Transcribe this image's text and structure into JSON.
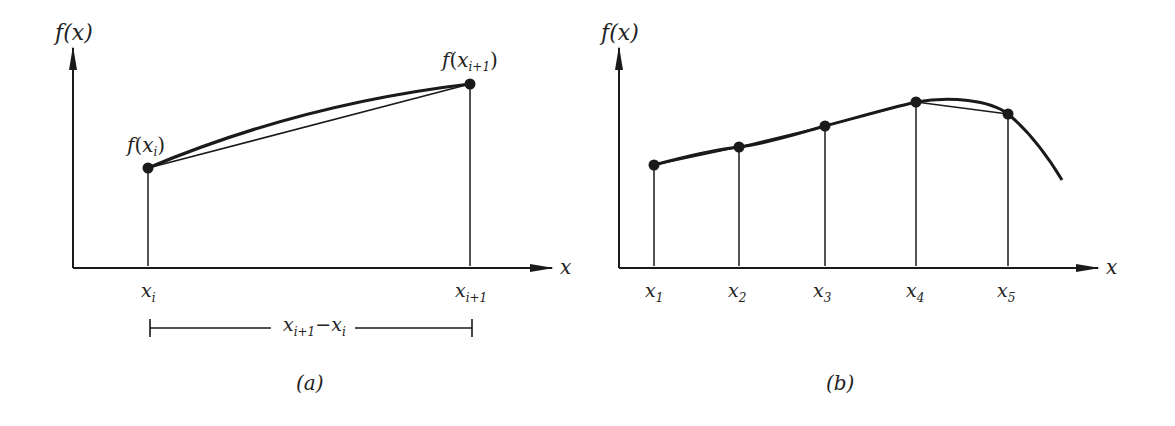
{
  "panel_a": {
    "y_axis_label": "f(x)",
    "x_axis_label": "x",
    "point_left_label": {
      "f": "f",
      "var": "x",
      "sub": "i"
    },
    "point_right_label": {
      "f": "f",
      "var": "x",
      "sub": "i+1"
    },
    "tick_left": {
      "var": "x",
      "sub": "i"
    },
    "tick_right": {
      "var": "x",
      "sub": "i+1"
    },
    "interval_label": {
      "var1": "x",
      "sub1": "i+1",
      "minus": "−",
      "var2": "x",
      "sub2": "i"
    },
    "caption": "(a)",
    "points": [
      [
        148,
        168
      ],
      [
        470,
        84
      ]
    ]
  },
  "panel_b": {
    "y_axis_label": "f(x)",
    "x_axis_label": "x",
    "ticks": [
      {
        "var": "x",
        "sub": "1"
      },
      {
        "var": "x",
        "sub": "2"
      },
      {
        "var": "x",
        "sub": "3"
      },
      {
        "var": "x",
        "sub": "4"
      },
      {
        "var": "x",
        "sub": "5"
      }
    ],
    "caption": "(b)",
    "points": [
      [
        655,
        165
      ],
      [
        739,
        147
      ],
      [
        825,
        126
      ],
      [
        916,
        102
      ],
      [
        1008,
        114
      ]
    ]
  },
  "colors": {
    "ink": "#1a1a1a",
    "background": "#ffffff"
  }
}
